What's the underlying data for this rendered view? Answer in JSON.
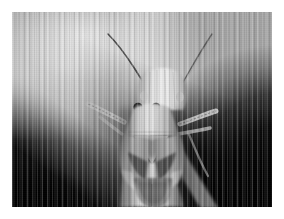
{
  "image": {
    "domain": "natural-image",
    "subject": "plant bug (Miridae) photographed head-on",
    "caption": "Black and white macro photograph of a plant bug facing the camera on a plant stem",
    "color_mode": "grayscale",
    "width": 284,
    "height": 219,
    "border": {
      "color": "#ffffff",
      "width_px": 12
    },
    "photo": {
      "x": 12,
      "y": 12,
      "width": 260,
      "height": 195
    },
    "artifacts": {
      "vertical_scan_striping": true,
      "film_grain": true
    },
    "palette": {
      "paper_white": "#ffffff",
      "background_light": "#d2d2d2",
      "background_mid": "#b2b2b2",
      "background_dark": "#000000",
      "body_highlight": "#e6e6e6",
      "body_mid": "#a8a8a8",
      "body_shadow": "#4a4a4a",
      "eye_dark": "#121212"
    },
    "subject_parts": [
      {
        "name": "left-antenna",
        "description": "long thin dark curving antenna sweeping to upper left"
      },
      {
        "name": "right-antenna",
        "description": "long thin dark curving antenna sweeping to upper right"
      },
      {
        "name": "head",
        "description": "pale rounded head with vertical striations"
      },
      {
        "name": "left-eye",
        "description": "small dark round compound eye"
      },
      {
        "name": "right-eye",
        "description": "small dark round compound eye"
      },
      {
        "name": "rostrum",
        "description": "pale beak / mouthparts pointing downward"
      },
      {
        "name": "pronotum",
        "description": "broad pale shield behind the head"
      },
      {
        "name": "scutellum",
        "description": "triangular plate with dark V marking"
      },
      {
        "name": "left-forewing",
        "description": "wing with dark cuneus wedge"
      },
      {
        "name": "right-forewing",
        "description": "wing with dark cuneus wedge"
      },
      {
        "name": "membrane",
        "description": "dark rounded wing membrane at the abdomen tip"
      },
      {
        "name": "left-foreleg",
        "description": "spiny tibia angled out to the left"
      },
      {
        "name": "right-foreleg",
        "description": "spiny tibia angled out to the right"
      },
      {
        "name": "plant-stem",
        "description": "bright vertical stem the insect is perched on"
      },
      {
        "name": "shadow-left",
        "description": "dark diagonal shadow band in the lower left"
      },
      {
        "name": "shadow-right",
        "description": "large dark mass filling the right side"
      }
    ]
  }
}
